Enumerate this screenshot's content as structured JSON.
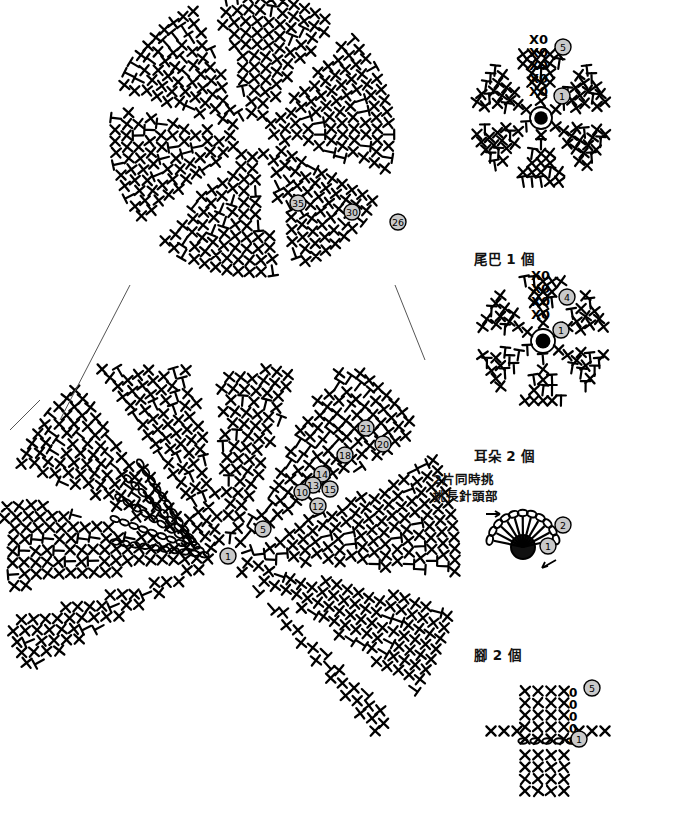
{
  "document": {
    "kind": "crochet-pattern-chart",
    "background_color": "#ffffff",
    "ink_color": "#000000",
    "marker_fill": "#c9c9c9",
    "width": 675,
    "height": 820
  },
  "labels": {
    "tail": "尾巴 1 個",
    "ear": "耳朵 2 個",
    "leg": "腳 2 個"
  },
  "annotations": {
    "line1": "2片同時挑",
    "line2": "挑長針頭部",
    "arrow": "→"
  },
  "symbols": {
    "single_crochet": "X",
    "half_double_crochet": "⊢",
    "chain": "0",
    "oval_chain": "⬭",
    "magic_ring": "●"
  },
  "diagrams": [
    {
      "name": "body-main-upper",
      "shape": "circular-radial",
      "center": [
        252,
        135
      ],
      "radius": 150,
      "round_markers": [
        "35",
        "30",
        "26"
      ],
      "marker_positions": [
        [
          298,
          203
        ],
        [
          352,
          212
        ],
        [
          398,
          222
        ]
      ]
    },
    {
      "name": "body-main-lower",
      "shape": "fan-radial",
      "center": [
        225,
        560
      ],
      "round_markers": [
        "21",
        "20",
        "18",
        "14",
        "13",
        "15",
        "10",
        "12",
        "5",
        "1"
      ],
      "marker_positions": [
        [
          366,
          428
        ],
        [
          383,
          444
        ],
        [
          345,
          455
        ],
        [
          322,
          474
        ],
        [
          313,
          485
        ],
        [
          330,
          489
        ],
        [
          302,
          492
        ],
        [
          318,
          506
        ],
        [
          263,
          529
        ],
        [
          228,
          556
        ]
      ]
    },
    {
      "name": "tail",
      "shape": "star-6-point",
      "center": [
        541,
        116
      ],
      "rounds": 5,
      "round_markers": [
        "5",
        "1"
      ],
      "marker_positions": [
        [
          563,
          47
        ],
        [
          562,
          96
        ]
      ],
      "chain_rows": [
        "X0",
        "X0",
        "X0",
        "X0",
        "X0"
      ]
    },
    {
      "name": "ear",
      "shape": "star-6-point",
      "center": [
        543,
        340
      ],
      "rounds": 4,
      "round_markers": [
        "4",
        "1"
      ],
      "marker_positions": [
        [
          567,
          297
        ],
        [
          561,
          330
        ]
      ],
      "chain_rows": [
        "0",
        "X0",
        "X0",
        "X0"
      ]
    },
    {
      "name": "leg-detail",
      "shape": "fan-scallop",
      "center": [
        523,
        543
      ],
      "round_markers": [
        "2",
        "1"
      ],
      "marker_positions": [
        [
          563,
          525
        ],
        [
          548,
          546
        ]
      ]
    },
    {
      "name": "leg",
      "shape": "cross-radial",
      "center": [
        553,
        741
      ],
      "rounds": 5,
      "round_markers": [
        "5",
        "1"
      ],
      "marker_positions": [
        [
          592,
          688
        ],
        [
          579,
          739
        ]
      ],
      "chain_rows": [
        "X X X X0",
        "X X X X0",
        "X X X X0",
        "X ⊻ 0",
        "X X0"
      ]
    }
  ]
}
